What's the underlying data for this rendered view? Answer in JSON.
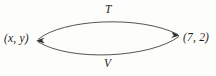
{
  "diagram": {
    "type": "two-way-mapping-diagram",
    "background_color": "#fdfdfc",
    "stroke_color": "#43423f",
    "text_color": "#1c1c1c",
    "nodes": [
      {
        "id": "left",
        "label": "(x, y)"
      },
      {
        "id": "right",
        "label": "(7, 2)"
      }
    ],
    "edges": [
      {
        "id": "top",
        "label": "T",
        "from": "left",
        "to": "right",
        "direction": "left-to-right",
        "curve": "arc-above"
      },
      {
        "id": "bottom",
        "label": "V",
        "from": "right",
        "to": "left",
        "direction": "right-to-left",
        "curve": "arc-below"
      }
    ]
  }
}
